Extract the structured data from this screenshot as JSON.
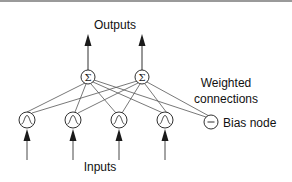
{
  "diagram": {
    "type": "neural-network",
    "labels": {
      "outputs": "Outputs",
      "weighted_connections_line1": "Weighted",
      "weighted_connections_line2": "connections",
      "bias_node": "Bias node",
      "inputs": "Inputs"
    },
    "sum_nodes": [
      {
        "id": "sum-1",
        "symbol": "Σ",
        "cx": 88,
        "cy": 77
      },
      {
        "id": "sum-2",
        "symbol": "Σ",
        "cx": 142,
        "cy": 77
      }
    ],
    "input_nodes": [
      {
        "id": "input-1",
        "icon": "bell-curve",
        "cx": 27,
        "cy": 120
      },
      {
        "id": "input-2",
        "icon": "bell-curve",
        "cx": 73,
        "cy": 120
      },
      {
        "id": "input-3",
        "icon": "bell-curve",
        "cx": 119,
        "cy": 120
      },
      {
        "id": "input-4",
        "icon": "bell-curve",
        "cx": 165,
        "cy": 120
      }
    ],
    "bias_node": {
      "id": "bias",
      "symbol": "−",
      "cx": 211,
      "cy": 122
    },
    "colors": {
      "stroke": "#1a1a1a",
      "connection": "#555555",
      "background": "#ffffff",
      "top_rule": "#9a9a9a"
    }
  }
}
